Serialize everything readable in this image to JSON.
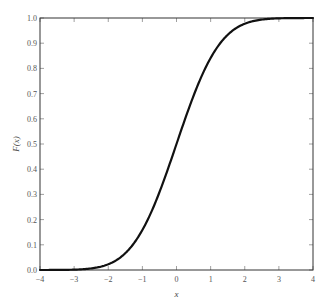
{
  "chart_data": {
    "type": "line",
    "title": "",
    "xlabel": "x",
    "ylabel": "F(x)",
    "xlim": [
      -4,
      4
    ],
    "ylim": [
      0.0,
      1.0
    ],
    "grid": false,
    "legend": null,
    "x_ticks": [
      -4,
      -3,
      -2,
      -1,
      0,
      1,
      2,
      3,
      4
    ],
    "x_tick_labels": [
      "-4",
      "-3",
      "-2",
      "-1",
      "0",
      "1",
      "2",
      "3",
      "4"
    ],
    "y_ticks": [
      0.0,
      0.1,
      0.2,
      0.3,
      0.4,
      0.5,
      0.6,
      0.7,
      0.8,
      0.9,
      1.0
    ],
    "y_tick_labels": [
      "0.0",
      "0.1",
      "0.2",
      "0.3",
      "0.4",
      "0.5",
      "0.6",
      "0.7",
      "0.8",
      "0.9",
      "1.0"
    ],
    "series": [
      {
        "name": "Standard normal CDF",
        "color": "#111111",
        "x": [
          -4,
          -3.5,
          -3,
          -2.5,
          -2,
          -1.5,
          -1,
          -0.5,
          0,
          0.5,
          1,
          1.5,
          2,
          2.5,
          3,
          3.5,
          4
        ],
        "values": [
          0.0,
          0.0002,
          0.0013,
          0.0062,
          0.0228,
          0.0668,
          0.1587,
          0.3085,
          0.5,
          0.6915,
          0.8413,
          0.9332,
          0.9772,
          0.9938,
          0.9987,
          0.9998,
          1.0
        ]
      }
    ]
  },
  "colors": {
    "curve": "#111111",
    "axes": "#333333",
    "background": "#ffffff"
  }
}
